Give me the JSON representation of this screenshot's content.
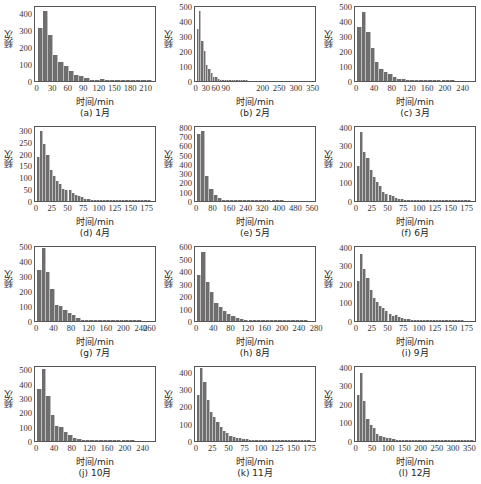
{
  "figure": {
    "ylabel": "频次",
    "xlabel": "时间/min",
    "bar_color": "#6e6e6e"
  },
  "chart_data": [
    {
      "type": "bar",
      "title": "(a) 1月",
      "xlabel": "时间/min",
      "ylabel": "频次",
      "ylim": [
        0,
        450
      ],
      "xlim": [
        -5,
        230
      ],
      "yticks": [
        0,
        100,
        200,
        300,
        400
      ],
      "xticks": [
        "0",
        "30",
        "60",
        "90",
        "120",
        "150",
        "180",
        "210"
      ],
      "xtick_values": [
        0,
        30,
        60,
        90,
        120,
        150,
        180,
        210
      ],
      "bin_width": 10,
      "values": [
        315,
        415,
        270,
        155,
        115,
        90,
        60,
        35,
        30,
        20,
        8,
        8,
        10,
        6,
        4,
        3,
        2,
        2,
        1,
        1,
        1,
        1,
        0
      ]
    },
    {
      "type": "bar",
      "title": "(b) 2月",
      "xlabel": "时间/min",
      "ylabel": "频次",
      "ylim": [
        0,
        510
      ],
      "xlim": [
        -5,
        360
      ],
      "yticks": [
        0,
        100,
        200,
        300,
        400,
        500
      ],
      "xticks": [
        "0",
        "30",
        "60",
        "90",
        "200",
        "250",
        "300",
        "350"
      ],
      "xtick_values": [
        0,
        30,
        60,
        90,
        200,
        250,
        300,
        350
      ],
      "bin_width": 7,
      "values": [
        350,
        470,
        270,
        200,
        110,
        80,
        55,
        30,
        25,
        15,
        10,
        8,
        5,
        4,
        3,
        2,
        2,
        1,
        1,
        1,
        1,
        1,
        0
      ]
    },
    {
      "type": "bar",
      "title": "(c) 3月",
      "xlabel": "时间/min",
      "ylabel": "频次",
      "ylim": [
        0,
        510
      ],
      "xlim": [
        -5,
        270
      ],
      "yticks": [
        0,
        100,
        200,
        300,
        400,
        500
      ],
      "xticks": [
        "0",
        "40",
        "80",
        "120",
        "160",
        "200",
        "240"
      ],
      "xtick_values": [
        0,
        40,
        80,
        120,
        160,
        200,
        240
      ],
      "bin_width": 10,
      "values": [
        360,
        460,
        330,
        220,
        130,
        80,
        60,
        45,
        30,
        15,
        15,
        10,
        6,
        4,
        3,
        3,
        2,
        2,
        1,
        1,
        1,
        1,
        0,
        0,
        0,
        0
      ]
    },
    {
      "type": "bar",
      "title": "(d) 4月",
      "xlabel": "时间/min",
      "ylabel": "频次",
      "ylim": [
        0,
        320
      ],
      "xlim": [
        -3,
        190
      ],
      "yticks": [
        0,
        50,
        100,
        150,
        200,
        250,
        300
      ],
      "xticks": [
        "0",
        "25",
        "50",
        "75",
        "100",
        "125",
        "150",
        "175"
      ],
      "xtick_values": [
        0,
        25,
        50,
        75,
        100,
        125,
        150,
        175
      ],
      "bin_width": 5,
      "values": [
        185,
        295,
        240,
        195,
        130,
        105,
        85,
        70,
        50,
        45,
        45,
        35,
        25,
        20,
        15,
        10,
        8,
        6,
        5,
        4,
        3,
        3,
        2,
        2,
        3,
        2,
        2,
        1,
        1,
        1,
        1,
        1,
        1,
        1,
        1,
        1,
        0,
        0
      ]
    },
    {
      "type": "bar",
      "title": "(e) 5月",
      "xlabel": "时间/min",
      "ylabel": "频次",
      "ylim": [
        0,
        820
      ],
      "xlim": [
        -10,
        580
      ],
      "yticks": [
        0,
        100,
        200,
        300,
        400,
        500,
        600,
        700,
        800
      ],
      "xticks": [
        "0",
        "80",
        "160",
        "240",
        "320",
        "400",
        "480",
        "560"
      ],
      "xtick_values": [
        0,
        80,
        160,
        240,
        320,
        400,
        480,
        560
      ],
      "bin_width": 20,
      "values": [
        720,
        760,
        270,
        130,
        60,
        30,
        15,
        10,
        6,
        4,
        3,
        2,
        2,
        1,
        1,
        1,
        1,
        1,
        1,
        1,
        1,
        0,
        0,
        0,
        0,
        0,
        0,
        0,
        0
      ]
    },
    {
      "type": "bar",
      "title": "(f) 6月",
      "xlabel": "时间/min",
      "ylabel": "频次",
      "ylim": [
        0,
        410
      ],
      "xlim": [
        -3,
        190
      ],
      "yticks": [
        0,
        100,
        200,
        300,
        400
      ],
      "xticks": [
        "0",
        "25",
        "50",
        "75",
        "100",
        "125",
        "150",
        "175"
      ],
      "xtick_values": [
        0,
        25,
        50,
        75,
        100,
        125,
        150,
        175
      ],
      "bin_width": 5,
      "values": [
        190,
        375,
        265,
        230,
        165,
        130,
        105,
        80,
        50,
        40,
        35,
        25,
        15,
        12,
        10,
        8,
        6,
        4,
        3,
        3,
        2,
        2,
        2,
        1,
        1,
        1,
        1,
        1,
        1,
        1,
        1,
        1,
        1,
        1,
        1,
        1,
        0,
        0
      ]
    },
    {
      "type": "bar",
      "title": "(g) 7月",
      "xlabel": "时间/min",
      "ylabel": "频次",
      "ylim": [
        0,
        510
      ],
      "xlim": [
        -5,
        275
      ],
      "yticks": [
        0,
        100,
        200,
        300,
        400,
        500
      ],
      "xticks": [
        "0",
        "40",
        "80",
        "120",
        "160",
        "200",
        "240",
        "260"
      ],
      "xtick_values": [
        0,
        40,
        80,
        120,
        160,
        200,
        240,
        260
      ],
      "bin_width": 10,
      "values": [
        340,
        490,
        330,
        215,
        105,
        100,
        75,
        55,
        40,
        20,
        10,
        6,
        5,
        4,
        3,
        2,
        3,
        2,
        1,
        1,
        1,
        1,
        1,
        1,
        0,
        0,
        0
      ]
    },
    {
      "type": "bar",
      "title": "(h) 8月",
      "xlabel": "时间/min",
      "ylabel": "频次",
      "ylim": [
        0,
        610
      ],
      "xlim": [
        -5,
        280
      ],
      "yticks": [
        0,
        100,
        200,
        300,
        400,
        500,
        600
      ],
      "xticks": [
        "0",
        "40",
        "80",
        "120",
        "160",
        "200",
        "240",
        "280"
      ],
      "xtick_values": [
        0,
        40,
        80,
        120,
        160,
        200,
        240,
        280
      ],
      "bin_width": 10,
      "values": [
        370,
        555,
        310,
        235,
        145,
        110,
        80,
        55,
        40,
        25,
        15,
        10,
        6,
        5,
        4,
        3,
        2,
        2,
        1,
        1,
        1,
        1,
        1,
        1,
        1,
        1,
        0,
        0
      ]
    },
    {
      "type": "bar",
      "title": "(i) 9月",
      "xlabel": "时间/min",
      "ylabel": "频次",
      "ylim": [
        0,
        410
      ],
      "xlim": [
        -3,
        190
      ],
      "yticks": [
        0,
        100,
        200,
        300,
        400
      ],
      "xticks": [
        "0",
        "25",
        "50",
        "75",
        "100",
        "125",
        "150",
        "175"
      ],
      "xtick_values": [
        0,
        25,
        50,
        75,
        100,
        125,
        150,
        175
      ],
      "bin_width": 5,
      "values": [
        215,
        360,
        280,
        230,
        165,
        125,
        100,
        80,
        70,
        55,
        40,
        25,
        30,
        20,
        15,
        12,
        10,
        8,
        5,
        4,
        3,
        2,
        2,
        2,
        1,
        1,
        1,
        1,
        1,
        1,
        1,
        1,
        1,
        1,
        0,
        0,
        0,
        0
      ]
    },
    {
      "type": "bar",
      "title": "(j) 10月",
      "xlabel": "时间/min",
      "ylabel": "频次",
      "ylim": [
        0,
        530
      ],
      "xlim": [
        -5,
        270
      ],
      "yticks": [
        0,
        100,
        200,
        300,
        400,
        500
      ],
      "xticks": [
        "0",
        "40",
        "80",
        "120",
        "160",
        "200",
        "240"
      ],
      "xtick_values": [
        0,
        40,
        80,
        120,
        160,
        200,
        240
      ],
      "bin_width": 10,
      "values": [
        365,
        500,
        315,
        180,
        105,
        95,
        60,
        40,
        20,
        15,
        10,
        6,
        4,
        3,
        3,
        2,
        2,
        1,
        1,
        1,
        1,
        1,
        0,
        0,
        0,
        0
      ]
    },
    {
      "type": "bar",
      "title": "(k) 11月",
      "xlabel": "时间/min",
      "ylabel": "频次",
      "ylim": [
        0,
        440
      ],
      "xlim": [
        -3,
        185
      ],
      "yticks": [
        0,
        100,
        200,
        300,
        400
      ],
      "xticks": [
        "0",
        "25",
        "50",
        "75",
        "100",
        "125",
        "150",
        "175"
      ],
      "xtick_values": [
        0,
        25,
        50,
        75,
        100,
        125,
        150,
        175
      ],
      "bin_width": 5,
      "values": [
        265,
        420,
        340,
        240,
        170,
        140,
        110,
        80,
        60,
        45,
        30,
        25,
        20,
        15,
        12,
        10,
        8,
        6,
        5,
        4,
        6,
        3,
        3,
        2,
        4,
        2,
        1,
        1,
        1,
        1,
        1,
        1,
        1,
        1,
        1,
        0,
        0
      ]
    },
    {
      "type": "bar",
      "title": "(l) 12月",
      "xlabel": "时间/min",
      "ylabel": "频次",
      "ylim": [
        0,
        410
      ],
      "xlim": [
        -5,
        370
      ],
      "yticks": [
        0,
        100,
        200,
        300,
        400
      ],
      "xticks": [
        "0",
        "50",
        "100",
        "150",
        "200",
        "250",
        "300",
        "350"
      ],
      "xtick_values": [
        0,
        50,
        100,
        150,
        200,
        250,
        300,
        350
      ],
      "bin_width": 10,
      "values": [
        250,
        365,
        215,
        120,
        85,
        70,
        40,
        25,
        20,
        15,
        15,
        10,
        8,
        6,
        4,
        3,
        3,
        2,
        2,
        2,
        1,
        1,
        1,
        1,
        1,
        1,
        1,
        1,
        1,
        1,
        1,
        1,
        1,
        1,
        1,
        1,
        0
      ]
    }
  ]
}
